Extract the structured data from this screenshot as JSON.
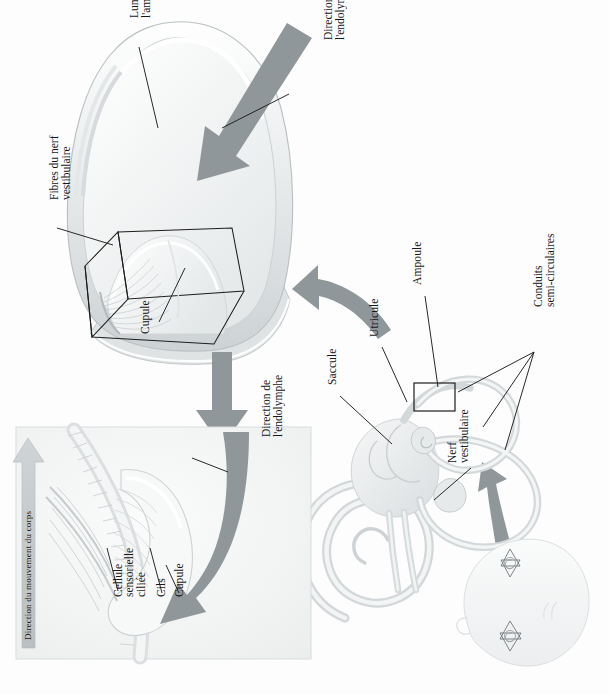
{
  "figure": {
    "language": "fr",
    "background_color": "#fdfdfd",
    "arrow_color": "#8f979b",
    "leader_color": "#1d1d1d",
    "tissue_light": "#f2f3f3",
    "tissue_mid": "#dfe2e3",
    "tissue_dark": "#c2c7c9"
  },
  "panels": {
    "ampulla": {
      "name": "Coupe de l'ampoule",
      "labels": {
        "lumiere": "Lumière de\nl'ampoule",
        "lumiere_line1": "Lumière de",
        "lumiere_line2": "l'ampoule",
        "direction_endolymphe": "Direction de\nl'endolymphe",
        "direction_endolymphe_line1": "Direction de",
        "direction_endolymphe_line2": "l'endolymphe",
        "fibres": "Fibres du nerf\nvestibulaire",
        "fibres_line1": "Fibres du nerf",
        "fibres_line2": "vestibulaire",
        "cupule": "Cupule"
      }
    },
    "inset": {
      "name": "Détail de la crête ampullaire",
      "labels": {
        "direction_endolymphe_line1": "Direction de",
        "direction_endolymphe_line2": "l'endolymphe",
        "direction_mouvement": "Direction du mouvement du corps",
        "cupule": "Cupule",
        "cils": "Cils",
        "cellule_line1": "Cellule",
        "cellule_line2": "sensorielle",
        "cellule_line3": "ciliée"
      }
    },
    "labyrinth": {
      "name": "Labyrinthe membraneux",
      "labels": {
        "ampoule": "Ampoule",
        "utricule": "Utricule",
        "saccule": "Saccule",
        "conduits_line1": "Conduits",
        "conduits_line2": "semi-circulaires",
        "nerf_line1": "Nerf",
        "nerf_line2": "vestibulaire"
      }
    },
    "head": {
      "name": "Situation dans la tête",
      "labels": {}
    }
  }
}
